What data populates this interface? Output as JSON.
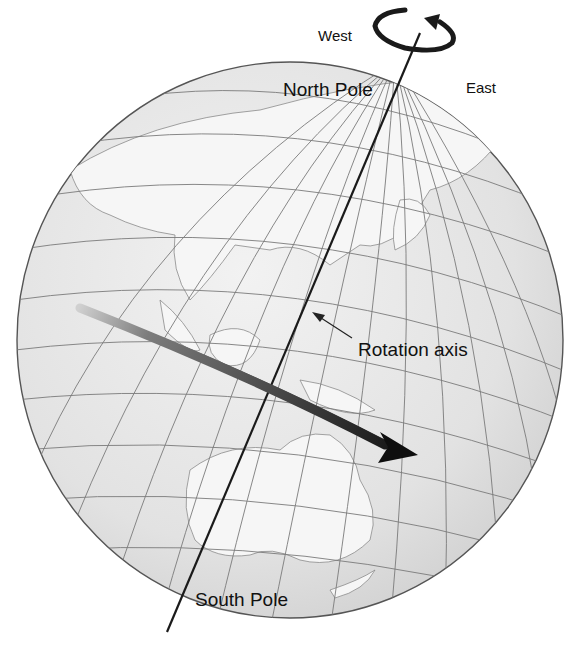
{
  "diagram": {
    "type": "globe-rotation",
    "labels": {
      "west": "West",
      "east": "East",
      "north_pole": "North Pole",
      "south_pole": "South Pole",
      "rotation_axis": "Rotation axis"
    },
    "colors": {
      "globe_fill": "#e6e6e6",
      "land_fill": "#f4f4f4",
      "grid_line": "#7a7a7a",
      "axis_line": "#1a1a1a",
      "arrow_dark": "#111111",
      "arrow_light": "#8a8a8a"
    }
  }
}
